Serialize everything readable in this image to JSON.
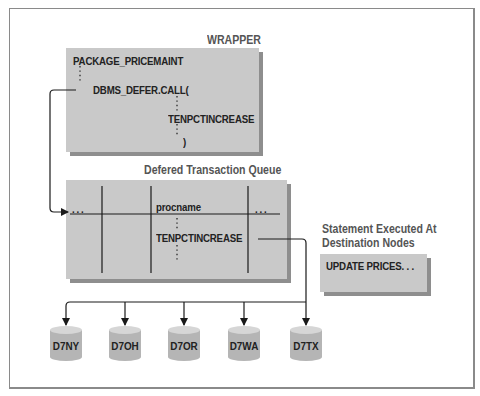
{
  "wrapper": {
    "title": "WRAPPER",
    "line1": "PACKAGE_PRICEMAINT",
    "line2": "DBMS_DEFER.CALL(",
    "line3": "TENPCTINCREASE",
    "line4": ")"
  },
  "queue": {
    "title": "Defered Transaction Queue",
    "left_ellipsis": "...",
    "column_header": "procname",
    "right_ellipsis": "...",
    "cell_value": "TENPCTINCREASE"
  },
  "statement": {
    "title_line1": "Statement Executed At",
    "title_line2": "Destination Nodes",
    "text": "UPDATE PRICES. . ."
  },
  "nodes": [
    {
      "label": "D7NY"
    },
    {
      "label": "D7OH"
    },
    {
      "label": "D7OR"
    },
    {
      "label": "D7WA"
    },
    {
      "label": "D7TX"
    }
  ],
  "colors": {
    "box_face": "#c9c9c9",
    "box_shadow": "#8e8e8e",
    "title_text": "#555555",
    "line": "#1a1a1a"
  }
}
